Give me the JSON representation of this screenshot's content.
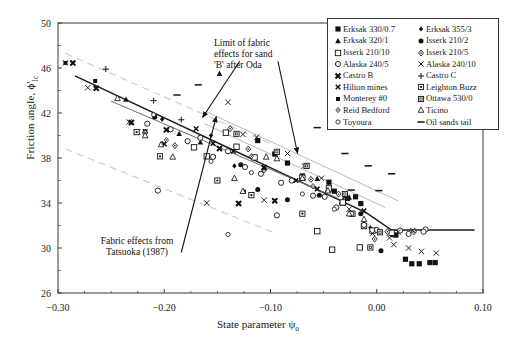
{
  "chart_data": {
    "type": "scatter",
    "title": "",
    "xlabel": "State parameter ψₒ",
    "ylabel": "Friction angle, ϕ'ₗc",
    "xlim": [
      -0.3,
      0.1
    ],
    "ylim": [
      26,
      50
    ],
    "xticks": [
      "-0.30",
      "-0.20",
      "-0.10",
      "0.00",
      "0.10"
    ],
    "xtick_values": [
      -0.3,
      -0.2,
      -0.1,
      0.0,
      0.1
    ],
    "yticks": [
      "26",
      "30",
      "34",
      "38",
      "42",
      "46",
      "50"
    ],
    "ytick_values": [
      26,
      30,
      34,
      38,
      42,
      46,
      50
    ],
    "grid": false,
    "minor_ticks": true,
    "legend_position": "top-right",
    "annotations": [
      {
        "id": "limit-of-fabric",
        "text_lines": [
          "Limit of fabric",
          "effects for sand",
          "'B' after Oda"
        ],
        "arrows": [
          {
            "x1": -0.129,
            "y1": 46.6,
            "x2": -0.164,
            "y2": 41.6
          },
          {
            "x1": -0.093,
            "y1": 46.6,
            "x2": -0.0745,
            "y2": 38.4
          }
        ]
      },
      {
        "id": "fabric-effects-tatsuoka",
        "text_lines": [
          "Fabric effects from",
          "Tatsuoka (1987)"
        ],
        "arrows": [
          {
            "x1": -0.184,
            "y1": 29.6,
            "x2": -0.151,
            "y2": 41.7
          }
        ]
      }
    ],
    "trend_lines": [
      {
        "name": "upper-solid",
        "style": "solid",
        "color": "#1b1b1b",
        "width": 1.4,
        "points": [
          [
            -0.284,
            45.3
          ],
          [
            -0.01,
            33.15
          ],
          [
            0.014,
            31.6
          ],
          [
            0.092,
            31.6
          ]
        ]
      },
      {
        "name": "lower-solid",
        "style": "solid",
        "color": "#6b6b6b",
        "width": 1.0,
        "points": [
          [
            -0.25,
            43.05
          ],
          [
            -0.036,
            34.4
          ]
        ]
      }
    ],
    "bound_lines": [
      {
        "name": "oda-upper",
        "style": "solid",
        "color": "#b9b9b9",
        "width": 1.0,
        "points": [
          [
            -0.16,
            42.1
          ],
          [
            0.02,
            34.2
          ]
        ]
      },
      {
        "name": "oda-lower",
        "style": "solid",
        "color": "#b9b9b9",
        "width": 1.0,
        "points": [
          [
            -0.162,
            41.05
          ],
          [
            0.008,
            33.6
          ]
        ]
      },
      {
        "name": "tatsuoka-upper",
        "style": "dashed",
        "color": "#cfcfcf",
        "width": 1.2,
        "points": [
          [
            -0.293,
            47.3
          ],
          [
            -0.098,
            39.2
          ]
        ]
      },
      {
        "name": "tatsuoka-lower",
        "style": "dashed",
        "color": "#cfcfcf",
        "width": 1.2,
        "points": [
          [
            -0.293,
            38.8
          ],
          [
            -0.098,
            31.4
          ]
        ]
      }
    ],
    "series": [
      {
        "name": "Erksak 330/0.7",
        "marker": "filled-square",
        "points": [
          [
            -0.112,
            39.55
          ],
          [
            -0.096,
            38.35
          ],
          [
            -0.084,
            37.55
          ],
          [
            -0.045,
            35.85
          ],
          [
            -0.04,
            35.05
          ],
          [
            -0.0275,
            34.4
          ],
          [
            -0.02,
            34.55
          ],
          [
            -0.015,
            33.95
          ],
          [
            0.015,
            31.2
          ],
          [
            0.018,
            31.15
          ],
          [
            0.033,
            28.6
          ],
          [
            0.05,
            28.7
          ],
          [
            0.055,
            28.7
          ],
          [
            0.027,
            29.0
          ],
          [
            -0.07,
            36.4
          ],
          [
            0.04,
            28.6
          ]
        ]
      },
      {
        "name": "Erksak 355/3",
        "marker": "small-filled-diamond",
        "points": [
          [
            -0.156,
            40.0
          ],
          [
            -0.134,
            37.3
          ],
          [
            -0.07,
            36.2
          ],
          [
            -0.03,
            33.95
          ],
          [
            -0.202,
            41.45
          ],
          [
            -0.006,
            31.8
          ]
        ]
      },
      {
        "name": "Erksak 320/1",
        "marker": "filled-triangle",
        "points": [
          [
            -0.236,
            43.2
          ],
          [
            -0.148,
            45.5
          ],
          [
            -0.166,
            39.4
          ],
          [
            -0.056,
            36.15
          ],
          [
            -0.046,
            35.2
          ],
          [
            -0.026,
            34.5
          ],
          [
            -0.186,
            40.15
          ]
        ]
      },
      {
        "name": "Isserk 210/2",
        "marker": "filled-circle",
        "points": [
          [
            -0.209,
            41.65
          ],
          [
            -0.128,
            37.4
          ],
          [
            -0.054,
            34.7
          ],
          [
            -0.033,
            33.95
          ],
          [
            -0.015,
            33.05
          ],
          [
            0.004,
            29.75
          ],
          [
            -0.112,
            35.2
          ],
          [
            -0.084,
            34.3
          ]
        ]
      },
      {
        "name": "Isserk 210/10",
        "marker": "open-square",
        "points": [
          [
            -0.142,
            40.25
          ],
          [
            -0.132,
            39.0
          ],
          [
            -0.172,
            38.95
          ],
          [
            -0.16,
            38.15
          ],
          [
            -0.115,
            38.05
          ],
          [
            -0.07,
            36.25
          ],
          [
            -0.045,
            35.3
          ],
          [
            -0.032,
            34.05
          ],
          [
            -0.023,
            33.05
          ],
          [
            -0.012,
            31.95
          ],
          [
            -0.004,
            31.55
          ],
          [
            0.014,
            31.35
          ],
          [
            -0.016,
            30.05
          ],
          [
            -0.042,
            29.85
          ],
          [
            -0.056,
            31.5
          ]
        ]
      },
      {
        "name": "Isserk 210/5",
        "marker": "open-diamond",
        "points": [
          [
            -0.218,
            40.3
          ],
          [
            -0.19,
            39.1
          ],
          [
            -0.138,
            40.6
          ],
          [
            -0.121,
            38.8
          ],
          [
            -0.062,
            36.1
          ],
          [
            -0.036,
            34.8
          ],
          [
            -0.106,
            36.95
          ],
          [
            0.01,
            31.45
          ],
          [
            0.035,
            31.45
          ],
          [
            -0.002,
            30.8
          ]
        ]
      },
      {
        "name": "Alaska 240/5",
        "marker": "open-circle",
        "points": [
          [
            -0.216,
            41.05
          ],
          [
            -0.194,
            40.55
          ],
          [
            -0.178,
            39.5
          ],
          [
            -0.166,
            39.8
          ],
          [
            -0.154,
            38.1
          ],
          [
            -0.14,
            38.6
          ],
          [
            -0.124,
            37.2
          ],
          [
            -0.109,
            36.6
          ],
          [
            -0.09,
            35.8
          ],
          [
            -0.08,
            36.0
          ],
          [
            -0.06,
            34.65
          ],
          [
            -0.049,
            34.55
          ],
          [
            -0.038,
            33.6
          ],
          [
            -0.024,
            33.05
          ],
          [
            -0.012,
            32.05
          ],
          [
            0.0,
            31.6
          ],
          [
            0.022,
            31.55
          ],
          [
            0.03,
            31.25
          ],
          [
            0.046,
            31.65
          ],
          [
            -0.206,
            35.1
          ],
          [
            -0.094,
            32.9
          ],
          [
            0.044,
            31.45
          ]
        ]
      },
      {
        "name": "Alaska 240/10",
        "marker": "cross-x",
        "points": [
          [
            -0.293,
            46.45
          ],
          [
            -0.272,
            44.25
          ],
          [
            -0.233,
            41.2
          ],
          [
            -0.225,
            40.3
          ],
          [
            -0.14,
            42.95
          ],
          [
            -0.126,
            40.1
          ],
          [
            -0.113,
            39.85
          ],
          [
            -0.084,
            38.4
          ],
          [
            -0.068,
            37.3
          ],
          [
            -0.052,
            36.2
          ],
          [
            -0.026,
            33.45
          ],
          [
            -0.004,
            31.3
          ],
          [
            0.012,
            30.9
          ],
          [
            0.016,
            30.3
          ],
          [
            0.03,
            30.0
          ],
          [
            0.042,
            29.7
          ],
          [
            0.056,
            29.55
          ],
          [
            0.02,
            31.4
          ],
          [
            0.034,
            31.55
          ],
          [
            -0.106,
            34.25
          ],
          [
            -0.16,
            34.0
          ]
        ]
      },
      {
        "name": "Castro B",
        "marker": "bold-x",
        "points": [
          [
            -0.286,
            46.45
          ],
          [
            -0.264,
            44.2
          ],
          [
            -0.231,
            41.15
          ],
          [
            -0.198,
            40.5
          ],
          [
            -0.148,
            38.85
          ],
          [
            -0.106,
            37.15
          ],
          [
            -0.096,
            34.2
          ],
          [
            -0.13,
            33.95
          ]
        ]
      },
      {
        "name": "Castro C",
        "marker": "plus",
        "points": [
          [
            -0.255,
            45.9
          ],
          [
            -0.21,
            43.1
          ],
          [
            -0.184,
            41.4
          ]
        ]
      },
      {
        "name": "Hilton mines",
        "marker": "small-x",
        "points": [
          [
            -0.218,
            40.35
          ],
          [
            -0.2,
            39.25
          ],
          [
            -0.17,
            40.6
          ],
          [
            -0.154,
            39.3
          ],
          [
            -0.135,
            38.6
          ],
          [
            -0.076,
            36.0
          ],
          [
            -0.056,
            35.25
          ],
          [
            -0.03,
            34.55
          ],
          [
            -0.012,
            33.3
          ]
        ]
      },
      {
        "name": "Leighton Buzz",
        "marker": "box-dot",
        "points": [
          [
            -0.226,
            40.3
          ],
          [
            -0.204,
            38.15
          ],
          [
            -0.15,
            36.0
          ],
          [
            -0.118,
            34.7
          ],
          [
            -0.07,
            33.05
          ]
        ]
      },
      {
        "name": "Monterey #0",
        "marker": "small-filled-square",
        "points": [
          [
            -0.265,
            44.85
          ],
          [
            -0.293,
            46.45
          ],
          [
            -0.209,
            41.7
          ],
          [
            -0.125,
            35.0
          ]
        ]
      },
      {
        "name": "Ottawa 530/0",
        "marker": "open-box",
        "points": [
          [
            -0.132,
            40.15
          ],
          [
            -0.094,
            38.55
          ],
          [
            -0.066,
            37.3
          ],
          [
            -0.03,
            34.8
          ],
          [
            -0.006,
            30.05
          ],
          [
            0.003,
            31.4
          ]
        ]
      },
      {
        "name": "Reid Bedford",
        "marker": "small-open-diamond",
        "points": [
          [
            -0.218,
            40.25
          ],
          [
            -0.198,
            39.6
          ],
          [
            -0.118,
            38.15
          ],
          [
            -0.06,
            35.5
          ]
        ]
      },
      {
        "name": "Ticino",
        "marker": "open-triangle",
        "points": [
          [
            -0.244,
            43.3
          ],
          [
            -0.218,
            40.0
          ],
          [
            -0.203,
            39.2
          ],
          [
            -0.192,
            38.1
          ],
          [
            -0.104,
            38.1
          ],
          [
            -0.094,
            37.95
          ],
          [
            -0.07,
            36.2
          ],
          [
            -0.046,
            35.1
          ],
          [
            -0.026,
            33.05
          ],
          [
            -0.012,
            32.55
          ],
          [
            -0.134,
            36.2
          ],
          [
            -0.126,
            35.05
          ]
        ]
      },
      {
        "name": "Toyoura",
        "marker": "small-open-circle",
        "points": [
          [
            -0.21,
            41.85
          ],
          [
            -0.156,
            37.7
          ],
          [
            -0.118,
            36.7
          ],
          [
            -0.07,
            34.8
          ],
          [
            -0.04,
            33.45
          ],
          [
            -0.14,
            31.2
          ]
        ]
      },
      {
        "name": "Oil sands tail",
        "marker": "dash",
        "points": [
          [
            -0.168,
            44.5
          ],
          [
            -0.188,
            43.6
          ],
          [
            -0.056,
            40.7
          ],
          [
            -0.03,
            38.4
          ],
          [
            -0.008,
            37.3
          ],
          [
            0.014,
            36.6
          ],
          [
            -0.024,
            35.15
          ],
          [
            0.002,
            35.1
          ]
        ]
      }
    ]
  },
  "legend": {
    "col1": [
      {
        "label": "Erksak 330/0.7",
        "marker": "filled-square"
      },
      {
        "label": "Erksak 320/1",
        "marker": "filled-triangle"
      },
      {
        "label": "Isserk 210/10",
        "marker": "open-square"
      },
      {
        "label": "Alaska 240/5",
        "marker": "open-circle"
      },
      {
        "label": "Castro B",
        "marker": "bold-x"
      },
      {
        "label": "Hilton mines",
        "marker": "small-x"
      },
      {
        "label": "Monterey #0",
        "marker": "small-filled-square"
      },
      {
        "label": "Reid Bedford",
        "marker": "small-open-diamond"
      },
      {
        "label": "Toyoura",
        "marker": "small-open-circle"
      }
    ],
    "col2": [
      {
        "label": "Erksak 355/3",
        "marker": "small-filled-diamond"
      },
      {
        "label": "Isserk 210/2",
        "marker": "filled-circle"
      },
      {
        "label": "Isserk 210/5",
        "marker": "open-diamond"
      },
      {
        "label": "Alaska 240/10",
        "marker": "cross-x"
      },
      {
        "label": "Castro C",
        "marker": "plus"
      },
      {
        "label": "Leighton Buzz",
        "marker": "box-dot"
      },
      {
        "label": "Ottawa 530/0",
        "marker": "open-box"
      },
      {
        "label": "Ticino",
        "marker": "open-triangle"
      },
      {
        "label": "Oil sands tail",
        "marker": "dash"
      }
    ]
  },
  "axes": {
    "xlabel_prefix": "State parameter ",
    "xlabel_symbol": "ψ",
    "xlabel_sub": "o",
    "ylabel_prefix": "Friction angle, ",
    "ylabel_symbol": "ϕ'",
    "ylabel_sub": "lc"
  },
  "annotations": {
    "oda_line1": "Limit of fabric",
    "oda_line2": "effects for sand",
    "oda_line3": "'B' after Oda",
    "tatsuoka_line1": "Fabric effects from",
    "tatsuoka_line2": "Tatsuoka (1987)"
  },
  "colors": {
    "axis": "#3a3a3a",
    "trend_dark": "#1b1b1b",
    "trend_grey": "#6b6b6b",
    "bound_grey": "#b9b9b9",
    "dashed_grey": "#cfcfcf",
    "marker": "#111111",
    "background": "#ffffff"
  }
}
